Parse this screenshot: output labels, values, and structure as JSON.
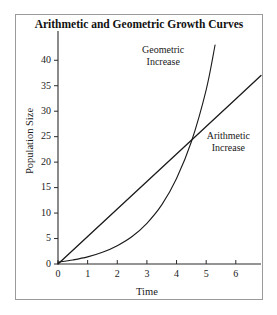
{
  "chart_data": {
    "type": "line",
    "title": "Arithmetic and Geometric Growth Curves",
    "xlabel": "Time",
    "ylabel": "Population Size",
    "xlim": [
      0,
      6.85
    ],
    "ylim": [
      0,
      43
    ],
    "grid": false,
    "legend": "none (inline annotations)",
    "xticks": [
      0,
      1,
      2,
      3,
      4,
      5,
      6
    ],
    "yticks": [
      0,
      5,
      10,
      15,
      20,
      25,
      30,
      35,
      40
    ],
    "annotations": [
      {
        "name": "geometric-increase",
        "line1": "Geometric",
        "line2": "Increase",
        "x": 3.55,
        "y": 41.5
      },
      {
        "name": "arithmetic-increase",
        "line1": "Arithmetic",
        "line2": "Increase",
        "x": 5.75,
        "y": 24.5
      }
    ],
    "series": [
      {
        "name": "Arithmetic Increase",
        "kind": "linear",
        "x": [
          0,
          1,
          2,
          3,
          4,
          5,
          6,
          6.85
        ],
        "values": [
          0,
          5.4,
          10.8,
          16.2,
          21.6,
          27.0,
          32.4,
          37.0
        ]
      },
      {
        "name": "Geometric Increase",
        "kind": "exponential",
        "x": [
          0,
          0.5,
          1,
          1.5,
          2,
          2.5,
          3,
          3.5,
          4,
          4.5,
          5,
          5.3
        ],
        "values": [
          0.35,
          0.8,
          1.4,
          2.3,
          3.6,
          5.4,
          8.0,
          11.6,
          16.8,
          24.0,
          34.2,
          43.0
        ]
      }
    ]
  },
  "axes_geometry": {
    "plot_left": 42,
    "plot_right": 245,
    "plot_top": 30,
    "plot_bottom": 249
  }
}
